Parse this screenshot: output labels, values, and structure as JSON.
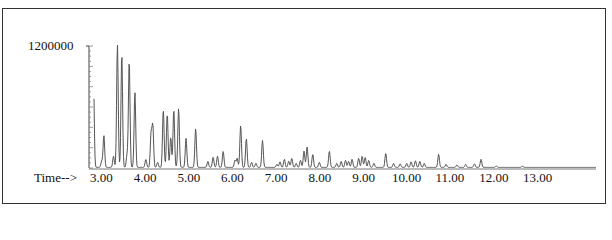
{
  "chart_data": {
    "type": "line",
    "title": "",
    "xlabel": "Time-->",
    "ylabel": "",
    "y_max_label": "1200000",
    "xlim": [
      2.7,
      14.0
    ],
    "ylim": [
      0,
      1200000
    ],
    "x_ticks": [
      "3.00",
      "4.00",
      "5.00",
      "6.00",
      "7.00",
      "8.00",
      "9.00",
      "10.00",
      "11.00",
      "12.00",
      "13.00"
    ],
    "grid": false,
    "legend": "none",
    "line_color": "#555555",
    "peaks": [
      {
        "t": 2.78,
        "h": 915000
      },
      {
        "t": 2.97,
        "h": 60000
      },
      {
        "t": 3.02,
        "h": 315000
      },
      {
        "t": 3.24,
        "h": 110000
      },
      {
        "t": 3.33,
        "h": 1210000
      },
      {
        "t": 3.43,
        "h": 1120000
      },
      {
        "t": 3.55,
        "h": 120000
      },
      {
        "t": 3.6,
        "h": 1050000
      },
      {
        "t": 3.73,
        "h": 740000
      },
      {
        "t": 3.98,
        "h": 80000
      },
      {
        "t": 4.1,
        "h": 330000
      },
      {
        "t": 4.14,
        "h": 405000
      },
      {
        "t": 4.25,
        "h": 50000
      },
      {
        "t": 4.38,
        "h": 570000
      },
      {
        "t": 4.47,
        "h": 530000
      },
      {
        "t": 4.55,
        "h": 300000
      },
      {
        "t": 4.62,
        "h": 570000
      },
      {
        "t": 4.73,
        "h": 580000
      },
      {
        "t": 4.9,
        "h": 285000
      },
      {
        "t": 5.12,
        "h": 385000
      },
      {
        "t": 5.4,
        "h": 60000
      },
      {
        "t": 5.52,
        "h": 100000
      },
      {
        "t": 5.62,
        "h": 110000
      },
      {
        "t": 5.75,
        "h": 160000
      },
      {
        "t": 6.02,
        "h": 70000
      },
      {
        "t": 6.07,
        "h": 90000
      },
      {
        "t": 6.15,
        "h": 415000
      },
      {
        "t": 6.28,
        "h": 285000
      },
      {
        "t": 6.4,
        "h": 50000
      },
      {
        "t": 6.5,
        "h": 40000
      },
      {
        "t": 6.65,
        "h": 265000
      },
      {
        "t": 6.98,
        "h": 30000
      },
      {
        "t": 7.05,
        "h": 55000
      },
      {
        "t": 7.15,
        "h": 80000
      },
      {
        "t": 7.25,
        "h": 60000
      },
      {
        "t": 7.32,
        "h": 90000
      },
      {
        "t": 7.42,
        "h": 40000
      },
      {
        "t": 7.52,
        "h": 70000
      },
      {
        "t": 7.6,
        "h": 160000
      },
      {
        "t": 7.67,
        "h": 200000
      },
      {
        "t": 7.8,
        "h": 130000
      },
      {
        "t": 7.95,
        "h": 50000
      },
      {
        "t": 8.18,
        "h": 160000
      },
      {
        "t": 8.35,
        "h": 40000
      },
      {
        "t": 8.45,
        "h": 60000
      },
      {
        "t": 8.55,
        "h": 70000
      },
      {
        "t": 8.62,
        "h": 60000
      },
      {
        "t": 8.7,
        "h": 80000
      },
      {
        "t": 8.85,
        "h": 90000
      },
      {
        "t": 8.93,
        "h": 110000
      },
      {
        "t": 9.0,
        "h": 100000
      },
      {
        "t": 9.08,
        "h": 70000
      },
      {
        "t": 9.2,
        "h": 40000
      },
      {
        "t": 9.47,
        "h": 140000
      },
      {
        "t": 9.65,
        "h": 40000
      },
      {
        "t": 9.8,
        "h": 35000
      },
      {
        "t": 9.95,
        "h": 40000
      },
      {
        "t": 10.05,
        "h": 55000
      },
      {
        "t": 10.15,
        "h": 65000
      },
      {
        "t": 10.25,
        "h": 60000
      },
      {
        "t": 10.35,
        "h": 40000
      },
      {
        "t": 10.68,
        "h": 130000
      },
      {
        "t": 10.85,
        "h": 30000
      },
      {
        "t": 11.1,
        "h": 25000
      },
      {
        "t": 11.3,
        "h": 30000
      },
      {
        "t": 11.5,
        "h": 35000
      },
      {
        "t": 11.65,
        "h": 80000
      },
      {
        "t": 12.0,
        "h": 15000
      },
      {
        "t": 12.6,
        "h": 12000
      }
    ]
  }
}
